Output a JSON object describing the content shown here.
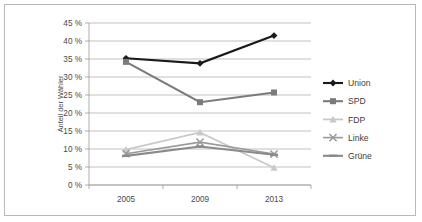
{
  "chart_data": {
    "type": "line",
    "title": "",
    "xlabel": "",
    "ylabel": "Anteil der Wähler",
    "categories": [
      "2005",
      "2009",
      "2013"
    ],
    "x": [
      2005,
      2009,
      2013
    ],
    "ylim": [
      0,
      45
    ],
    "ytick_step": 5,
    "ytick_labels": [
      "0 %",
      "5 %",
      "10 %",
      "15 %",
      "20 %",
      "25 %",
      "30 %",
      "35 %",
      "40 %",
      "45 %"
    ],
    "ytick_values": [
      0,
      5,
      10,
      15,
      20,
      25,
      30,
      35,
      40,
      45
    ],
    "grid": true,
    "legend_position": "right",
    "series": [
      {
        "name": "Union",
        "values": [
          35.2,
          33.8,
          41.5
        ],
        "color": "#1a1a1a",
        "marker": "diamond",
        "line_width": 2.1
      },
      {
        "name": "SPD",
        "values": [
          34.2,
          23.0,
          25.7
        ],
        "color": "#7b7b7b",
        "marker": "square",
        "line_width": 2.1
      },
      {
        "name": "FDP",
        "values": [
          9.8,
          14.6,
          4.8
        ],
        "color": "#c9c9c9",
        "marker": "triangle",
        "line_width": 1.8
      },
      {
        "name": "Linke",
        "values": [
          8.7,
          11.9,
          8.6
        ],
        "color": "#9a9a9a",
        "marker": "cross",
        "line_width": 1.6
      },
      {
        "name": "Grüne",
        "values": [
          8.1,
          10.7,
          8.4
        ],
        "color": "#8a8a8a",
        "marker": "line",
        "line_width": 2.1
      }
    ]
  },
  "legend": {
    "items": [
      {
        "label": "Union"
      },
      {
        "label": "SPD"
      },
      {
        "label": "FDP"
      },
      {
        "label": "Linke"
      },
      {
        "label": "Grüne"
      }
    ]
  }
}
